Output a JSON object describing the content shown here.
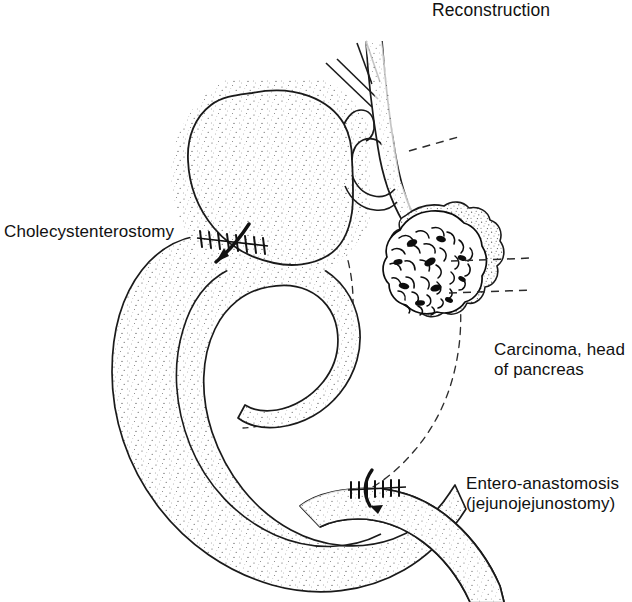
{
  "figure": {
    "title": "Reconstruction",
    "kind": "medical-line-illustration",
    "background_color": "#ffffff",
    "ink_color": "#111111"
  },
  "labels": {
    "title": "Reconstruction",
    "cholecystenterostomy": "Cholecystenterostomy",
    "carcinoma_line1": "Carcinoma, head",
    "carcinoma_line2": "of pancreas",
    "entero_line1": "Entero-anastomosis",
    "entero_line2": "(jejunojejunostomy)"
  },
  "structures": [
    {
      "name": "gallbladder",
      "label": "Gallbladder (stippled sac)"
    },
    {
      "name": "cystic-duct",
      "label": "Cystic duct"
    },
    {
      "name": "common-hepatic-duct",
      "label": "Common hepatic duct and hepatic radicles"
    },
    {
      "name": "common-bile-duct",
      "label": "Common bile duct descending to pancreatic head"
    },
    {
      "name": "pancreas-head",
      "label": "Head of pancreas"
    },
    {
      "name": "carcinoma-mass",
      "label": "Carcinoma of the head of the pancreas"
    },
    {
      "name": "jejunal-loop",
      "label": "Jejunal loop brought up to the gallbladder"
    },
    {
      "name": "duodenum-outline",
      "label": "Duodenal C-loop (dashed, behind)"
    },
    {
      "name": "cholecystenterostomy-anastomosis",
      "label": "Cholecystenterostomy suture line"
    },
    {
      "name": "jejunojejunostomy-anastomosis",
      "label": "Jejunojejunostomy suture line"
    }
  ],
  "annotations": {
    "flow_arrows": [
      {
        "name": "bile-flow-arrow",
        "at": "cholecystenterostomy",
        "direction": "down-left into jejunum"
      },
      {
        "name": "chyme-flow-arrow",
        "at": "jejunojejunostomy",
        "direction": "down-right into efferent limb"
      }
    ],
    "leader_lines": [
      {
        "name": "leader-to-bile-duct",
        "style": "dashed"
      },
      {
        "name": "leader-to-carcinoma-upper",
        "style": "dashed"
      },
      {
        "name": "leader-to-carcinoma-lower",
        "style": "dashed"
      }
    ]
  }
}
